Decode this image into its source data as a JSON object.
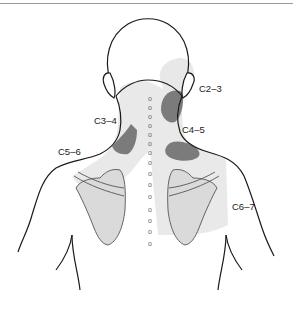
{
  "diagram": {
    "labels": [
      {
        "id": "c2-3",
        "text": "C2–3",
        "x": 199,
        "y": 92
      },
      {
        "id": "c3-4",
        "text": "C3–4",
        "x": 94,
        "y": 124
      },
      {
        "id": "c4-5",
        "text": "C4–5",
        "x": 182,
        "y": 133
      },
      {
        "id": "c5-6",
        "text": "C5–6",
        "x": 58,
        "y": 155
      },
      {
        "id": "c6-7",
        "text": "C6–7",
        "x": 232,
        "y": 210
      }
    ],
    "spine_markers": {
      "glyph": "o",
      "count": 15
    },
    "colors": {
      "outline": "#1a1a1a",
      "light_region": "#e6e6e6",
      "dark_region": "#7a7a7a",
      "scapula_fill": "#dadada",
      "spine_marker": "#666666",
      "top_rule": "#9a9a9a"
    }
  }
}
